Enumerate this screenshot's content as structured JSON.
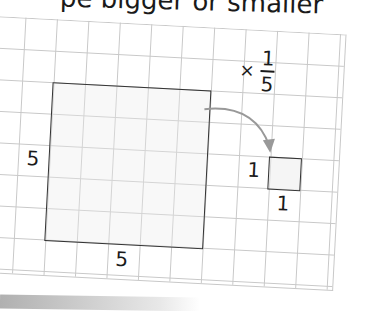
{
  "heading": {
    "text": "pe bigger or smaller"
  },
  "diagram": {
    "scale_factor": {
      "operator": "×",
      "numerator": "1",
      "denominator": "5"
    },
    "large_square": {
      "side_label": "5",
      "bottom_label": "5"
    },
    "small_square": {
      "side_label": "1",
      "bottom_label": "1"
    },
    "colors": {
      "grid": "#c8c8c8",
      "outline": "#333333",
      "arrow": "#999999",
      "text": "#1a1a1a"
    }
  }
}
